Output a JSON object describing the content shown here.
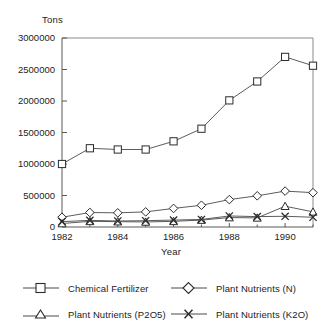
{
  "top_clipped_text": "",
  "axis": {
    "y_title": "Tons",
    "x_title": "Year",
    "y_ticks": [
      "0",
      "500000",
      "1000000",
      "1500000",
      "2000000",
      "2500000",
      "3000000"
    ],
    "x_ticks": [
      "1982",
      "1984",
      "1986",
      "1988",
      "1990"
    ]
  },
  "legend": {
    "items": [
      {
        "label": "Chemical Fertilizer",
        "marker": "square-marker"
      },
      {
        "label": "Plant Nutrients (N)",
        "marker": "diamond-marker"
      },
      {
        "label": "Plant Nutrients (P2O5)",
        "marker": "triangle-marker"
      },
      {
        "label": "Plant Nutrients (K2O)",
        "marker": "cross-marker"
      }
    ]
  },
  "colors": {
    "line": "#4a4a4c",
    "marker_stroke": "#2b2b2d",
    "marker_fill": "#ffffff",
    "axis": "#58585a",
    "background": "#ffffff"
  },
  "chart_data": {
    "type": "line",
    "title": "",
    "xlabel": "Year",
    "ylabel": "Tons",
    "xlim": [
      1982,
      1991
    ],
    "ylim": [
      0,
      3000000
    ],
    "ytick_step": 500000,
    "grid": false,
    "legend_position": "bottom",
    "x": [
      1982,
      1983,
      1984,
      1985,
      1986,
      1987,
      1988,
      1989,
      1990,
      1991
    ],
    "xtick_labels": [
      "1982",
      "1984",
      "1986",
      "1988",
      "1990"
    ],
    "series": [
      {
        "name": "Chemical Fertilizer",
        "marker": "square",
        "values": [
          1000000,
          1250000,
          1230000,
          1230000,
          1360000,
          1560000,
          2010000,
          2310000,
          2700000,
          2560000
        ]
      },
      {
        "name": "Plant Nutrients (N)",
        "marker": "diamond",
        "values": [
          155000,
          230000,
          225000,
          240000,
          295000,
          345000,
          435000,
          495000,
          570000,
          545000
        ]
      },
      {
        "name": "Plant Nutrients (P2O5)",
        "marker": "triangle",
        "values": [
          55000,
          90000,
          85000,
          80000,
          90000,
          110000,
          150000,
          145000,
          330000,
          240000
        ]
      },
      {
        "name": "Plant Nutrients (K2O)",
        "marker": "cross",
        "values": [
          85000,
          105000,
          95000,
          100000,
          110000,
          120000,
          175000,
          165000,
          170000,
          155000
        ]
      }
    ]
  }
}
